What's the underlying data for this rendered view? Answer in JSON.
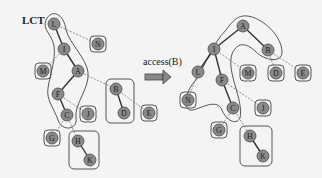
{
  "title": "LCT",
  "operation": {
    "label": "access(B)"
  },
  "colors": {
    "node_fill": "#8a8a8a",
    "node_stroke": "#4a4a4a",
    "solid_edge": "#333333",
    "dashed_edge": "#777777",
    "outline": "#444444"
  },
  "before": {
    "nodes": [
      {
        "id": "L",
        "x": 54,
        "y": 24
      },
      {
        "id": "I",
        "x": 64,
        "y": 49
      },
      {
        "id": "N",
        "x": 98,
        "y": 44
      },
      {
        "id": "M",
        "x": 43,
        "y": 71
      },
      {
        "id": "A",
        "x": 78,
        "y": 71
      },
      {
        "id": "F",
        "x": 58,
        "y": 94
      },
      {
        "id": "B",
        "x": 116,
        "y": 89
      },
      {
        "id": "D",
        "x": 124,
        "y": 113
      },
      {
        "id": "E",
        "x": 149,
        "y": 113
      },
      {
        "id": "J",
        "x": 88,
        "y": 114
      },
      {
        "id": "C",
        "x": 67,
        "y": 115
      },
      {
        "id": "G",
        "x": 52,
        "y": 138
      },
      {
        "id": "H",
        "x": 78,
        "y": 141
      },
      {
        "id": "K",
        "x": 90,
        "y": 160
      }
    ]
  },
  "after": {
    "nodes": [
      {
        "id": "A",
        "x": 243,
        "y": 26
      },
      {
        "id": "I",
        "x": 214,
        "y": 49
      },
      {
        "id": "B",
        "x": 268,
        "y": 50
      },
      {
        "id": "L",
        "x": 198,
        "y": 72
      },
      {
        "id": "M",
        "x": 248,
        "y": 73
      },
      {
        "id": "D",
        "x": 276,
        "y": 73
      },
      {
        "id": "E",
        "x": 303,
        "y": 73
      },
      {
        "id": "F",
        "x": 222,
        "y": 80
      },
      {
        "id": "N",
        "x": 188,
        "y": 100
      },
      {
        "id": "C",
        "x": 233,
        "y": 108
      },
      {
        "id": "J",
        "x": 263,
        "y": 108
      },
      {
        "id": "G",
        "x": 219,
        "y": 130
      },
      {
        "id": "H",
        "x": 250,
        "y": 136
      },
      {
        "id": "K",
        "x": 263,
        "y": 156
      }
    ]
  }
}
